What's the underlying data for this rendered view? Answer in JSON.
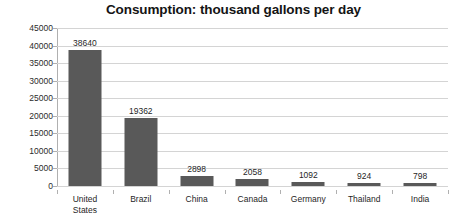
{
  "chart_data": {
    "type": "bar",
    "title": "Consumption: thousand gallons per day",
    "xlabel": "",
    "ylabel": "",
    "categories": [
      "United States",
      "Brazil",
      "China",
      "Canada",
      "Germany",
      "Thailand",
      "India"
    ],
    "values": [
      38640,
      19362,
      2898,
      2058,
      1092,
      924,
      798
    ],
    "data_labels": [
      "38640",
      "19362",
      "2898",
      "2058",
      "1092",
      "924",
      "798"
    ],
    "ylim": [
      0,
      45000
    ],
    "ytick_labels": [
      "45000",
      "40000",
      "35000",
      "30000",
      "25000",
      "20000",
      "15000",
      "10000",
      "5000",
      "0"
    ],
    "ytick_values": [
      45000,
      40000,
      35000,
      30000,
      25000,
      20000,
      15000,
      10000,
      5000,
      0
    ],
    "grid": true,
    "legend": false,
    "series": [
      {
        "name": "Consumption",
        "values": [
          38640,
          19362,
          2898,
          2058,
          1092,
          924,
          798
        ]
      }
    ],
    "colors": {
      "bar": "#595959",
      "gridline": "#d4d4d4",
      "axis": "#a8a8a8",
      "text": "#1f1f1f",
      "background": "#ffffff"
    }
  }
}
